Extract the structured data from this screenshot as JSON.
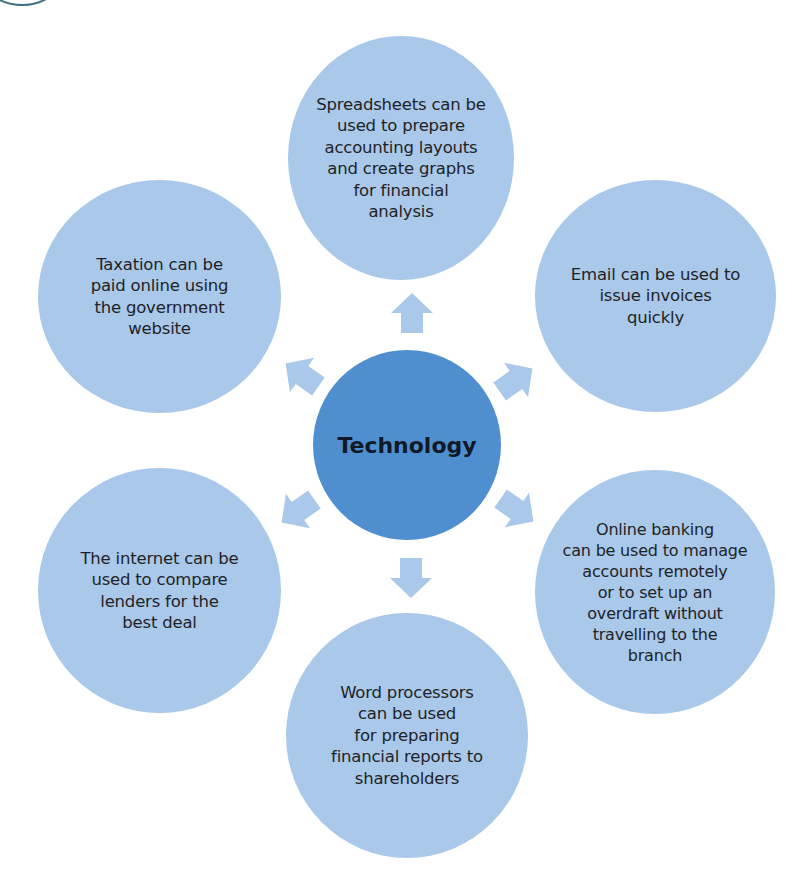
{
  "diagram": {
    "type": "radial-mind-map",
    "center": {
      "label": "Technology",
      "color": "#4f8fd0"
    },
    "node_color": "#a9c8ea",
    "arrow_color": "#a9c8ea",
    "nodes": [
      {
        "position": "top",
        "text": "Spreadsheets can be\nused to prepare\naccounting layouts\nand create graphs\nfor financial\nanalysis"
      },
      {
        "position": "top-right",
        "text": "Email can be used to\nissue invoices\nquickly"
      },
      {
        "position": "bottom-right",
        "text": "Online banking\ncan be used to manage\naccounts remotely\nor to set up an\noverdraft without\ntravelling to the\nbranch"
      },
      {
        "position": "bottom",
        "text": "Word processors\ncan be used\nfor preparing\nfinancial reports to\nshareholders"
      },
      {
        "position": "bottom-left",
        "text": "The internet can be\nused to compare\nlenders for the\nbest deal"
      },
      {
        "position": "top-left",
        "text": "Taxation can be\npaid online using\nthe government\nwebsite"
      }
    ]
  }
}
